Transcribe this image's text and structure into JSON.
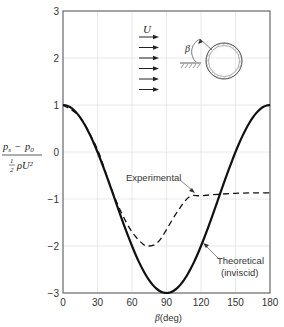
{
  "chart_data": {
    "type": "line",
    "title": "",
    "xlabel": "β (deg)",
    "ylabel": "(p_s − p_0) / (½ ρ U²)",
    "xlim": [
      0,
      180
    ],
    "ylim": [
      -3,
      3
    ],
    "x_ticks": [
      "0",
      "30",
      "60",
      "90",
      "120",
      "150",
      "180"
    ],
    "y_ticks": [
      "3",
      "2",
      "1",
      "0",
      "−1",
      "−2",
      "−3"
    ],
    "grid": true,
    "series": [
      {
        "name": "Theoretical (inviscid)",
        "style": "solid",
        "formula": "1 - 4 sin^2(beta)",
        "x": [
          0,
          15,
          30,
          45,
          60,
          75,
          90,
          105,
          120,
          135,
          150,
          165,
          180
        ],
        "values": [
          1.0,
          0.73,
          0.0,
          -1.0,
          -2.0,
          -2.73,
          -3.0,
          -2.73,
          -2.0,
          -1.0,
          0.0,
          0.73,
          1.0
        ]
      },
      {
        "name": "Experimental",
        "style": "dashed",
        "x": [
          0,
          15,
          30,
          40,
          50,
          60,
          70,
          75,
          80,
          85,
          90,
          100,
          110,
          120,
          135,
          150,
          165,
          180
        ],
        "values": [
          1.0,
          0.73,
          0.05,
          -0.65,
          -1.25,
          -1.7,
          -1.97,
          -2.0,
          -1.97,
          -1.85,
          -1.65,
          -1.25,
          -0.95,
          -0.93,
          -0.9,
          -0.88,
          -0.87,
          -0.87
        ]
      }
    ],
    "annotations": [
      {
        "text": "Experimental",
        "points_to": "Experimental curve near β≈110°"
      },
      {
        "text": "Theoretical",
        "text2": "(inviscid)",
        "points_to": "Theoretical curve near β≈120°"
      }
    ],
    "inset": {
      "flow_label": "U",
      "angle_label": "β",
      "description": "Uniform flow U from left approaching a circular cylinder; β measured from the front stagnation point"
    }
  },
  "axes": {
    "xlabel_symbol": "β",
    "xlabel_unit": "(deg)",
    "ylabel_numerator_a": "p",
    "ylabel_numerator_a_sub": "s",
    "ylabel_minus": "−",
    "ylabel_numerator_b": "p",
    "ylabel_numerator_b_sub": "0",
    "ylabel_den_half_num": "1",
    "ylabel_den_half_den": "2",
    "ylabel_den_rest": "ρU²"
  }
}
